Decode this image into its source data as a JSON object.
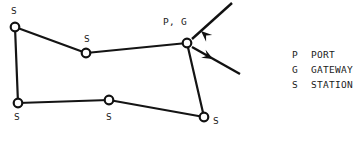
{
  "diagram": {
    "background_color": "#ffffff",
    "line_color": "#141414",
    "node_fill": "#ffffff",
    "nodes": [
      {
        "id": "n1",
        "label": "S",
        "role": "station",
        "x": 15,
        "y": 27,
        "label_x": 11,
        "label_y": 14
      },
      {
        "id": "n2",
        "label": "S",
        "role": "station",
        "x": 86,
        "y": 53,
        "label_x": 84,
        "label_y": 42
      },
      {
        "id": "n3",
        "label": "P, G",
        "role": "port-gateway",
        "x": 187,
        "y": 43,
        "label_x": 163,
        "label_y": 25
      },
      {
        "id": "n4",
        "label": "S",
        "role": "station",
        "x": 18,
        "y": 103,
        "label_x": 14,
        "label_y": 120
      },
      {
        "id": "n5",
        "label": "S",
        "role": "station",
        "x": 109,
        "y": 100,
        "label_x": 106,
        "label_y": 120
      },
      {
        "id": "n6",
        "label": "S",
        "role": "station",
        "x": 204,
        "y": 117,
        "label_x": 213,
        "label_y": 124
      }
    ],
    "edges": [
      {
        "from": "n1",
        "to": "n2"
      },
      {
        "from": "n2",
        "to": "n3"
      },
      {
        "from": "n1",
        "to": "n4"
      },
      {
        "from": "n4",
        "to": "n5"
      },
      {
        "from": "n5",
        "to": "n6"
      },
      {
        "from": "n3",
        "to": "n6"
      }
    ],
    "external_links": [
      {
        "id": "uplink-in",
        "name": "incoming-link-arrow",
        "direction": "inbound",
        "x1": 232,
        "y1": 3,
        "x2": 192,
        "y2": 39,
        "head_x": 201,
        "head_y": 31,
        "head_angle": 222
      },
      {
        "id": "uplink-out",
        "name": "outgoing-link-arrow",
        "direction": "outbound",
        "x1": 192,
        "y1": 47,
        "x2": 240,
        "y2": 74,
        "head_x": 213,
        "head_y": 59,
        "head_angle": 29
      }
    ]
  },
  "legend": {
    "rows": [
      {
        "key": "P",
        "label": "PORT"
      },
      {
        "key": "G",
        "label": "GATEWAY"
      },
      {
        "key": "S",
        "label": "STATION"
      }
    ],
    "key_x": 292,
    "label_x": 311,
    "start_y": 58,
    "row_step": 15
  }
}
